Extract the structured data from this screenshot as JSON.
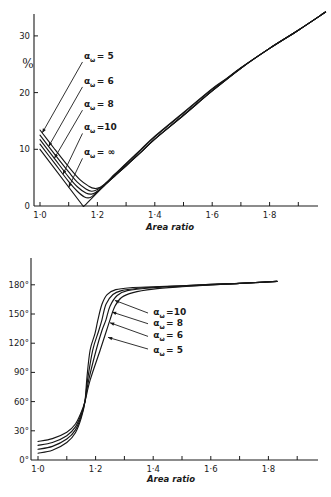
{
  "figure": {
    "panels": [
      "loss-vs-area-ratio",
      "phase-vs-area-ratio"
    ]
  },
  "chart_data": [
    {
      "id": "loss",
      "type": "line",
      "title": "",
      "xlabel": "Area ratio",
      "ylabel": "%",
      "xlim": [
        1.0,
        2.0
      ],
      "ylim": [
        0,
        35
      ],
      "grid": false,
      "legend_position": "inline annotations with leader arrows",
      "x_ticks": [
        {
          "value": 1.0,
          "label": "1·0"
        },
        {
          "value": 1.1,
          "label": ""
        },
        {
          "value": 1.2,
          "label": "1·2"
        },
        {
          "value": 1.3,
          "label": ""
        },
        {
          "value": 1.4,
          "label": "1·4"
        },
        {
          "value": 1.5,
          "label": ""
        },
        {
          "value": 1.6,
          "label": "1·6"
        },
        {
          "value": 1.7,
          "label": ""
        },
        {
          "value": 1.8,
          "label": "1·8"
        },
        {
          "value": 1.9,
          "label": ""
        }
      ],
      "y_ticks": [
        {
          "value": 0,
          "label": "0"
        },
        {
          "value": 10,
          "label": "10"
        },
        {
          "value": 20,
          "label": "20"
        },
        {
          "value": 30,
          "label": "30"
        }
      ],
      "series": [
        {
          "name": "α_ω = 5",
          "alpha_omega": "5",
          "points": [
            [
              1.0,
              13.4
            ],
            [
              1.05,
              10.1
            ],
            [
              1.1,
              6.9
            ],
            [
              1.14,
              4.6
            ],
            [
              1.17,
              3.5
            ],
            [
              1.19,
              3.1
            ],
            [
              1.21,
              3.3
            ],
            [
              1.23,
              4.1
            ],
            [
              1.26,
              5.6
            ],
            [
              1.3,
              7.5
            ],
            [
              1.35,
              9.9
            ],
            [
              1.4,
              12.3
            ],
            [
              1.5,
              16.5
            ],
            [
              1.6,
              20.7
            ],
            [
              1.65,
              22.5
            ],
            [
              1.7,
              24.4
            ],
            [
              1.8,
              27.8
            ],
            [
              1.9,
              31.0
            ],
            [
              1.995,
              34.2
            ]
          ]
        },
        {
          "name": "α_ω = 6",
          "alpha_omega": "6",
          "points": [
            [
              1.0,
              12.5
            ],
            [
              1.05,
              9.2
            ],
            [
              1.1,
              6.0
            ],
            [
              1.13,
              4.2
            ],
            [
              1.16,
              3.0
            ],
            [
              1.18,
              2.6
            ],
            [
              1.2,
              2.9
            ],
            [
              1.23,
              4.0
            ],
            [
              1.26,
              5.5
            ],
            [
              1.3,
              7.4
            ],
            [
              1.35,
              9.8
            ],
            [
              1.4,
              12.2
            ],
            [
              1.5,
              16.4
            ],
            [
              1.6,
              20.6
            ],
            [
              1.65,
              22.4
            ],
            [
              1.7,
              24.35
            ],
            [
              1.8,
              27.8
            ],
            [
              1.9,
              31.0
            ],
            [
              1.995,
              34.2
            ]
          ]
        },
        {
          "name": "α_ω = 8",
          "alpha_omega": "8",
          "points": [
            [
              1.0,
              11.7
            ],
            [
              1.05,
              8.4
            ],
            [
              1.1,
              5.1
            ],
            [
              1.13,
              3.4
            ],
            [
              1.16,
              2.3
            ],
            [
              1.18,
              2.1
            ],
            [
              1.2,
              2.6
            ],
            [
              1.23,
              3.9
            ],
            [
              1.26,
              5.3
            ],
            [
              1.3,
              7.1
            ],
            [
              1.35,
              9.4
            ],
            [
              1.4,
              11.8
            ],
            [
              1.5,
              16.0
            ],
            [
              1.6,
              20.3
            ],
            [
              1.7,
              24.3
            ],
            [
              1.8,
              27.8
            ],
            [
              1.9,
              31.0
            ],
            [
              1.995,
              34.2
            ]
          ]
        },
        {
          "name": "α_ω = 10",
          "alpha_omega": "10",
          "points": [
            [
              1.0,
              10.9
            ],
            [
              1.05,
              7.6
            ],
            [
              1.1,
              4.3
            ],
            [
              1.13,
              2.6
            ],
            [
              1.155,
              1.6
            ],
            [
              1.175,
              1.5
            ],
            [
              1.195,
              2.3
            ],
            [
              1.23,
              3.9
            ],
            [
              1.26,
              5.3
            ],
            [
              1.3,
              7.1
            ],
            [
              1.35,
              9.4
            ],
            [
              1.4,
              11.8
            ],
            [
              1.5,
              16.0
            ],
            [
              1.6,
              20.3
            ],
            [
              1.7,
              24.3
            ],
            [
              1.8,
              27.8
            ],
            [
              1.9,
              31.0
            ],
            [
              1.995,
              34.2
            ]
          ]
        },
        {
          "name": "α_ω = ∞",
          "alpha_omega": "∞",
          "points": [
            [
              1.0,
              10.0
            ],
            [
              1.15,
              0.0
            ],
            [
              1.16,
              0.3
            ],
            [
              1.23,
              3.9
            ],
            [
              1.26,
              5.3
            ],
            [
              1.3,
              7.1
            ],
            [
              1.35,
              9.4
            ],
            [
              1.4,
              11.8
            ],
            [
              1.5,
              16.0
            ],
            [
              1.6,
              20.3
            ],
            [
              1.7,
              24.3
            ],
            [
              1.8,
              27.8
            ],
            [
              1.9,
              31.0
            ],
            [
              1.995,
              34.2
            ]
          ],
          "sharp": true
        }
      ],
      "annotations": [
        {
          "series": "α_ω = 5",
          "symbol": "α",
          "subscript": "ω",
          "relation": "=",
          "value": "5",
          "label_at": [
            1.153,
            26.5
          ],
          "arrow_from": [
            1.148,
            25.4
          ],
          "arrow_to": [
            1.008,
            12.9
          ]
        },
        {
          "series": "α_ω = 6",
          "symbol": "α",
          "subscript": "ω",
          "relation": "=",
          "value": "6",
          "label_at": [
            1.153,
            22.0
          ],
          "arrow_from": [
            1.148,
            21.0
          ],
          "arrow_to": [
            1.03,
            10.5
          ]
        },
        {
          "series": "α_ω = 8",
          "symbol": "α",
          "subscript": "ω",
          "relation": "=",
          "value": "8",
          "label_at": [
            1.153,
            18.0
          ],
          "arrow_from": [
            1.148,
            16.9
          ],
          "arrow_to": [
            1.05,
            8.4
          ]
        },
        {
          "series": "α_ω = 10",
          "symbol": "α",
          "subscript": "ω",
          "relation": "=",
          "value": "10",
          "label_at": [
            1.153,
            13.9
          ],
          "arrow_from": [
            1.148,
            12.8
          ],
          "arrow_to": [
            1.08,
            5.6
          ]
        },
        {
          "series": "α_ω = ∞",
          "symbol": "α",
          "subscript": "ω",
          "relation": "=",
          "value": "∞",
          "label_at": [
            1.153,
            9.5
          ],
          "arrow_from": [
            1.148,
            8.4
          ],
          "arrow_to": [
            1.1,
            3.3
          ]
        }
      ]
    },
    {
      "id": "phase",
      "type": "line",
      "title": "",
      "xlabel": "Area ratio",
      "ylabel": "",
      "xlim": [
        1.0,
        2.0
      ],
      "ylim": [
        0,
        200
      ],
      "grid": false,
      "legend_position": "inline annotations with leader arrows",
      "x_ticks": [
        {
          "value": 1.0,
          "label": "1·0"
        },
        {
          "value": 1.1,
          "label": ""
        },
        {
          "value": 1.2,
          "label": "1·2"
        },
        {
          "value": 1.3,
          "label": ""
        },
        {
          "value": 1.4,
          "label": "1·4"
        },
        {
          "value": 1.5,
          "label": ""
        },
        {
          "value": 1.6,
          "label": "1·6"
        },
        {
          "value": 1.7,
          "label": ""
        },
        {
          "value": 1.8,
          "label": "1·8"
        },
        {
          "value": 1.9,
          "label": ""
        }
      ],
      "y_ticks": [
        {
          "value": 0,
          "label": "0°"
        },
        {
          "value": 30,
          "label": "30°"
        },
        {
          "value": 60,
          "label": "60°"
        },
        {
          "value": 90,
          "label": "90°"
        },
        {
          "value": 120,
          "label": "120°"
        },
        {
          "value": 150,
          "label": "150°"
        },
        {
          "value": 180,
          "label": "180°"
        }
      ],
      "series": [
        {
          "name": "α_ω = 10",
          "alpha_omega": "10",
          "points": [
            [
              1.0,
              7
            ],
            [
              1.05,
              10
            ],
            [
              1.1,
              18
            ],
            [
              1.13,
              28
            ],
            [
              1.15,
              43
            ],
            [
              1.163,
              60
            ],
            [
              1.17,
              85
            ],
            [
              1.181,
              113
            ],
            [
              1.198,
              130
            ],
            [
              1.208,
              144
            ],
            [
              1.222,
              160
            ],
            [
              1.24,
              170
            ],
            [
              1.27,
              175
            ],
            [
              1.32,
              177
            ],
            [
              1.4,
              178
            ],
            [
              1.5,
              179
            ],
            [
              1.6,
              180.5
            ],
            [
              1.7,
              181.5
            ],
            [
              1.83,
              183.5
            ]
          ]
        },
        {
          "name": "α_ω = 8",
          "alpha_omega": "8",
          "points": [
            [
              1.0,
              11
            ],
            [
              1.05,
              14
            ],
            [
              1.1,
              21.5
            ],
            [
              1.13,
              31
            ],
            [
              1.15,
              45
            ],
            [
              1.163,
              60
            ],
            [
              1.172,
              82
            ],
            [
              1.19,
              113
            ],
            [
              1.21,
              132
            ],
            [
              1.222,
              144
            ],
            [
              1.236,
              160
            ],
            [
              1.26,
              170
            ],
            [
              1.29,
              174
            ],
            [
              1.35,
              176.5
            ],
            [
              1.4,
              177.5
            ],
            [
              1.5,
              179
            ],
            [
              1.6,
              180.5
            ],
            [
              1.7,
              181.5
            ],
            [
              1.83,
              183.5
            ]
          ]
        },
        {
          "name": "α_ω = 6",
          "alpha_omega": "6",
          "points": [
            [
              1.0,
              15
            ],
            [
              1.05,
              18
            ],
            [
              1.1,
              25
            ],
            [
              1.13,
              34
            ],
            [
              1.15,
              47
            ],
            [
              1.163,
              60
            ],
            [
              1.176,
              82
            ],
            [
              1.202,
              113
            ],
            [
              1.222,
              133
            ],
            [
              1.236,
              144
            ],
            [
              1.25,
              158
            ],
            [
              1.275,
              169
            ],
            [
              1.31,
              174
            ],
            [
              1.4,
              177
            ],
            [
              1.5,
              178.5
            ],
            [
              1.6,
              180
            ],
            [
              1.7,
              181.5
            ],
            [
              1.83,
              183.5
            ]
          ]
        },
        {
          "name": "α_ω = 5",
          "alpha_omega": "5",
          "points": [
            [
              1.0,
              19
            ],
            [
              1.05,
              22
            ],
            [
              1.1,
              28.5
            ],
            [
              1.13,
              37
            ],
            [
              1.15,
              49
            ],
            [
              1.163,
              60
            ],
            [
              1.181,
              82
            ],
            [
              1.216,
              113
            ],
            [
              1.238,
              133
            ],
            [
              1.25,
              144
            ],
            [
              1.267,
              158
            ],
            [
              1.29,
              167
            ],
            [
              1.33,
              172
            ],
            [
              1.4,
              175.5
            ],
            [
              1.5,
              178
            ],
            [
              1.6,
              180
            ],
            [
              1.7,
              181.5
            ],
            [
              1.83,
              183.5
            ]
          ]
        }
      ],
      "annotations": [
        {
          "series": "α_ω = 10",
          "symbol": "α",
          "subscript": "ω",
          "relation": "=",
          "value": "10",
          "label_at": [
            1.4,
            152
          ],
          "arrow_from": [
            1.382,
            151
          ],
          "arrow_to": [
            1.267,
            164
          ]
        },
        {
          "series": "α_ω = 8",
          "symbol": "α",
          "subscript": "ω",
          "relation": "=",
          "value": "8",
          "label_at": [
            1.4,
            141
          ],
          "arrow_from": [
            1.382,
            140
          ],
          "arrow_to": [
            1.257,
            152
          ]
        },
        {
          "series": "α_ω = 6",
          "symbol": "α",
          "subscript": "ω",
          "relation": "=",
          "value": "6",
          "label_at": [
            1.4,
            128
          ],
          "arrow_from": [
            1.382,
            127
          ],
          "arrow_to": [
            1.25,
            141
          ]
        },
        {
          "series": "α_ω = 5",
          "symbol": "α",
          "subscript": "ω",
          "relation": "=",
          "value": "5",
          "label_at": [
            1.4,
            113
          ],
          "arrow_from": [
            1.382,
            114
          ],
          "arrow_to": [
            1.243,
            126
          ]
        }
      ]
    }
  ]
}
